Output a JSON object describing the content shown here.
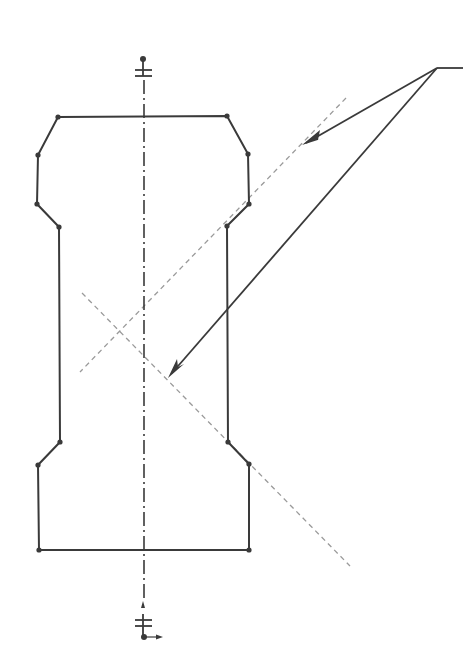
{
  "drawing": {
    "type": "cad-sketch",
    "colors": {
      "profile": "#3a3a3a",
      "section_lines": "#9a9a9a",
      "background": "#ffffff"
    },
    "profile_vertices": [
      [
        58,
        117
      ],
      [
        227,
        116
      ],
      [
        248,
        154
      ],
      [
        249,
        204
      ],
      [
        227,
        226
      ],
      [
        228,
        442
      ],
      [
        249,
        464
      ],
      [
        249,
        550
      ],
      [
        39,
        550
      ],
      [
        38,
        465
      ],
      [
        60,
        442
      ],
      [
        59,
        227
      ],
      [
        37,
        204
      ],
      [
        38,
        155
      ]
    ],
    "centerline": {
      "x": 144,
      "y_start": 62,
      "y_end": 600
    },
    "section_lines": [
      {
        "from": [
          346,
          98
        ],
        "to": [
          80,
          372
        ]
      },
      {
        "from": [
          82,
          293
        ],
        "to": [
          350,
          566
        ]
      }
    ],
    "leaders": {
      "origin": [
        437,
        68
      ],
      "tail_end": [
        463,
        68
      ],
      "arrows": [
        {
          "tip": [
            302,
            145
          ]
        },
        {
          "tip": [
            168,
            378
          ]
        }
      ]
    },
    "symbols": {
      "top_constraint": {
        "dot": [
          143,
          59
        ],
        "bars_y": [
          70,
          76
        ]
      },
      "bottom_constraint": {
        "marker": [
          143,
          605
        ],
        "bars_y": [
          620,
          626
        ],
        "dot": [
          144,
          637
        ],
        "arrow_end": [
          162,
          637
        ]
      }
    }
  }
}
